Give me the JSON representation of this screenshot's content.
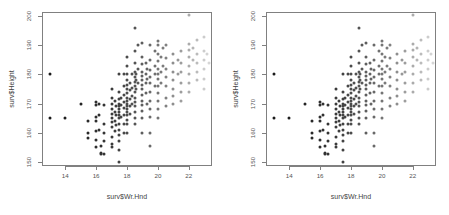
{
  "figure": {
    "title": "",
    "background": "#ffffff",
    "panel_count": 2
  },
  "chart_data": {
    "type": "scatter",
    "title": "",
    "subtitle": "",
    "xlabel": "surv$Wr.Hnd",
    "ylabel": "surv$Height",
    "xlim": [
      12.5,
      23.5
    ],
    "ylim": [
      148.5,
      201.5
    ],
    "xticks": [
      14,
      16,
      18,
      20,
      22
    ],
    "yticks": [
      150,
      160,
      170,
      180,
      190,
      200
    ],
    "grid": false,
    "legend": null,
    "marker": "filled-circle",
    "colormap": "grayscale-by-x (dark at low x, light at high x)",
    "colors": {
      "darkest": "#1a1a1a",
      "mid": "#777777",
      "lightest": "#dcdcdc",
      "frame": "#808080",
      "label": "#555555"
    },
    "panels": [
      {
        "name": "left-panel",
        "xlabel": "surv$Wr.Hnd",
        "ylabel": "surv$Height"
      },
      {
        "name": "right-panel",
        "xlabel": "surv$Wr.Hnd",
        "ylabel": "surv$Height"
      }
    ],
    "points": [
      [
        13.0,
        180.3
      ],
      [
        13.0,
        165.0
      ],
      [
        14.0,
        165.0
      ],
      [
        15.0,
        170.0
      ],
      [
        15.5,
        164.0
      ],
      [
        15.5,
        160.0
      ],
      [
        15.5,
        158.0
      ],
      [
        16.0,
        170.5
      ],
      [
        16.0,
        169.5
      ],
      [
        16.0,
        165.5
      ],
      [
        16.0,
        164.0
      ],
      [
        16.0,
        160.5
      ],
      [
        16.0,
        157.5
      ],
      [
        16.0,
        155.0
      ],
      [
        16.2,
        170.0
      ],
      [
        16.2,
        166.0
      ],
      [
        16.2,
        161.0
      ],
      [
        16.3,
        155.5
      ],
      [
        16.3,
        153.0
      ],
      [
        16.3,
        152.5
      ],
      [
        16.5,
        169.5
      ],
      [
        16.5,
        163.0
      ],
      [
        16.5,
        160.0
      ],
      [
        16.5,
        157.0
      ],
      [
        16.5,
        152.5
      ],
      [
        17.0,
        175.0
      ],
      [
        17.0,
        172.0
      ],
      [
        17.0,
        170.0
      ],
      [
        17.0,
        168.0
      ],
      [
        17.0,
        166.5
      ],
      [
        17.0,
        165.0
      ],
      [
        17.0,
        163.5
      ],
      [
        17.0,
        162.0
      ],
      [
        17.0,
        158.5
      ],
      [
        17.0,
        156.0
      ],
      [
        17.0,
        155.0
      ],
      [
        17.2,
        171.0
      ],
      [
        17.2,
        167.0
      ],
      [
        17.2,
        164.0
      ],
      [
        17.2,
        160.5
      ],
      [
        17.3,
        169.0
      ],
      [
        17.3,
        166.0
      ],
      [
        17.3,
        162.5
      ],
      [
        17.5,
        180.0
      ],
      [
        17.5,
        174.0
      ],
      [
        17.5,
        171.5
      ],
      [
        17.5,
        170.0
      ],
      [
        17.5,
        169.0
      ],
      [
        17.5,
        168.0
      ],
      [
        17.5,
        167.0
      ],
      [
        17.5,
        166.0
      ],
      [
        17.5,
        165.0
      ],
      [
        17.5,
        163.0
      ],
      [
        17.5,
        161.0
      ],
      [
        17.5,
        159.0
      ],
      [
        17.5,
        157.0
      ],
      [
        17.5,
        154.0
      ],
      [
        17.5,
        150.0
      ],
      [
        17.6,
        172.0
      ],
      [
        17.6,
        169.5
      ],
      [
        17.6,
        165.5
      ],
      [
        17.8,
        180.0
      ],
      [
        17.8,
        176.0
      ],
      [
        17.8,
        173.0
      ],
      [
        17.8,
        170.5
      ],
      [
        17.8,
        168.5
      ],
      [
        17.8,
        166.0
      ],
      [
        17.8,
        163.0
      ],
      [
        17.8,
        160.0
      ],
      [
        18.0,
        186.0
      ],
      [
        18.0,
        183.0
      ],
      [
        18.0,
        180.0
      ],
      [
        18.0,
        178.0
      ],
      [
        18.0,
        176.5
      ],
      [
        18.0,
        175.0
      ],
      [
        18.0,
        173.5
      ],
      [
        18.0,
        172.0
      ],
      [
        18.0,
        171.0
      ],
      [
        18.0,
        170.0
      ],
      [
        18.0,
        169.0
      ],
      [
        18.0,
        168.0
      ],
      [
        18.0,
        167.0
      ],
      [
        18.0,
        166.0
      ],
      [
        18.0,
        164.5
      ],
      [
        18.0,
        163.0
      ],
      [
        18.0,
        160.0
      ],
      [
        18.2,
        177.0
      ],
      [
        18.2,
        174.5
      ],
      [
        18.2,
        171.5
      ],
      [
        18.2,
        169.0
      ],
      [
        18.2,
        166.5
      ],
      [
        18.3,
        180.0
      ],
      [
        18.3,
        175.5
      ],
      [
        18.3,
        172.5
      ],
      [
        18.3,
        170.0
      ],
      [
        18.5,
        196.0
      ],
      [
        18.5,
        188.0
      ],
      [
        18.5,
        184.0
      ],
      [
        18.5,
        181.0
      ],
      [
        18.5,
        179.0
      ],
      [
        18.5,
        177.5
      ],
      [
        18.5,
        176.0
      ],
      [
        18.5,
        174.0
      ],
      [
        18.5,
        172.0
      ],
      [
        18.5,
        170.5
      ],
      [
        18.5,
        169.0
      ],
      [
        18.5,
        167.0
      ],
      [
        18.5,
        165.0
      ],
      [
        18.5,
        163.0
      ],
      [
        18.6,
        180.0
      ],
      [
        18.6,
        178.0
      ],
      [
        18.6,
        175.0
      ],
      [
        18.7,
        190.0
      ],
      [
        18.7,
        182.0
      ],
      [
        18.7,
        177.0
      ],
      [
        19.0,
        191.0
      ],
      [
        19.0,
        186.0
      ],
      [
        19.0,
        183.5
      ],
      [
        19.0,
        181.0
      ],
      [
        19.0,
        179.5
      ],
      [
        19.0,
        178.0
      ],
      [
        19.0,
        176.5
      ],
      [
        19.0,
        175.0
      ],
      [
        19.0,
        173.0
      ],
      [
        19.0,
        171.0
      ],
      [
        19.0,
        169.5
      ],
      [
        19.0,
        167.5
      ],
      [
        19.0,
        165.0
      ],
      [
        19.0,
        160.0
      ],
      [
        19.2,
        184.0
      ],
      [
        19.2,
        180.0
      ],
      [
        19.2,
        177.0
      ],
      [
        19.2,
        173.5
      ],
      [
        19.3,
        182.0
      ],
      [
        19.3,
        178.5
      ],
      [
        19.3,
        170.0
      ],
      [
        19.5,
        190.0
      ],
      [
        19.5,
        185.0
      ],
      [
        19.5,
        181.5
      ],
      [
        19.5,
        179.0
      ],
      [
        19.5,
        177.0
      ],
      [
        19.5,
        174.0
      ],
      [
        19.5,
        171.0
      ],
      [
        19.5,
        168.0
      ],
      [
        19.5,
        165.5
      ],
      [
        19.5,
        160.0
      ],
      [
        19.5,
        155.5
      ],
      [
        19.8,
        188.0
      ],
      [
        19.8,
        183.0
      ],
      [
        19.8,
        180.0
      ],
      [
        19.8,
        176.0
      ],
      [
        20.0,
        191.5
      ],
      [
        20.0,
        190.0
      ],
      [
        20.0,
        187.0
      ],
      [
        20.0,
        184.5
      ],
      [
        20.0,
        182.0
      ],
      [
        20.0,
        180.0
      ],
      [
        20.0,
        178.5
      ],
      [
        20.0,
        176.0
      ],
      [
        20.0,
        173.5
      ],
      [
        20.0,
        171.0
      ],
      [
        20.0,
        168.0
      ],
      [
        20.0,
        165.0
      ],
      [
        20.2,
        186.0
      ],
      [
        20.2,
        181.0
      ],
      [
        20.2,
        177.0
      ],
      [
        20.3,
        189.0
      ],
      [
        20.3,
        183.0
      ],
      [
        20.5,
        190.0
      ],
      [
        20.5,
        185.5
      ],
      [
        20.5,
        182.0
      ],
      [
        20.5,
        179.0
      ],
      [
        20.5,
        176.0
      ],
      [
        20.5,
        172.0
      ],
      [
        20.5,
        169.0
      ],
      [
        21.0,
        187.0
      ],
      [
        21.0,
        184.0
      ],
      [
        21.0,
        181.0
      ],
      [
        21.0,
        178.0
      ],
      [
        21.0,
        175.0
      ],
      [
        21.0,
        172.5
      ],
      [
        21.0,
        170.0
      ],
      [
        21.3,
        185.0
      ],
      [
        21.3,
        180.0
      ],
      [
        21.5,
        188.0
      ],
      [
        21.5,
        184.0
      ],
      [
        21.5,
        181.0
      ],
      [
        21.5,
        177.0
      ],
      [
        21.5,
        174.0
      ],
      [
        21.5,
        171.0
      ],
      [
        22.0,
        200.5
      ],
      [
        22.0,
        190.5
      ],
      [
        22.0,
        188.5
      ],
      [
        22.0,
        186.0
      ],
      [
        22.0,
        183.0
      ],
      [
        22.0,
        180.0
      ],
      [
        22.0,
        177.0
      ],
      [
        22.0,
        174.0
      ],
      [
        22.3,
        189.0
      ],
      [
        22.3,
        185.0
      ],
      [
        22.5,
        192.0
      ],
      [
        22.5,
        187.0
      ],
      [
        22.5,
        184.0
      ],
      [
        22.5,
        181.0
      ],
      [
        22.5,
        178.0
      ],
      [
        23.0,
        193.0
      ],
      [
        23.0,
        188.0
      ],
      [
        23.0,
        185.0
      ],
      [
        23.0,
        182.0
      ],
      [
        23.0,
        178.5
      ],
      [
        23.0,
        175.0
      ],
      [
        23.2,
        187.0
      ],
      [
        23.3,
        184.0
      ]
    ]
  }
}
